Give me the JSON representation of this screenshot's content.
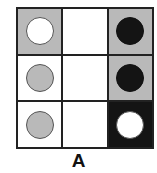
{
  "diagram": {
    "label": "A",
    "colors": {
      "grid_line": "#222222",
      "gray": "#b9b9b9",
      "white": "#ffffff",
      "black": "#141414"
    },
    "cells": [
      {
        "row": 0,
        "col": 0,
        "fill": "gray",
        "circle": "white"
      },
      {
        "row": 0,
        "col": 1,
        "fill": "white",
        "circle": null
      },
      {
        "row": 0,
        "col": 2,
        "fill": "gray",
        "circle": "black"
      },
      {
        "row": 1,
        "col": 0,
        "fill": "white",
        "circle": "gray"
      },
      {
        "row": 1,
        "col": 1,
        "fill": "white",
        "circle": null
      },
      {
        "row": 1,
        "col": 2,
        "fill": "gray",
        "circle": "black"
      },
      {
        "row": 2,
        "col": 0,
        "fill": "white",
        "circle": "gray"
      },
      {
        "row": 2,
        "col": 1,
        "fill": "white",
        "circle": null
      },
      {
        "row": 2,
        "col": 2,
        "fill": "black",
        "circle": "white"
      }
    ]
  }
}
